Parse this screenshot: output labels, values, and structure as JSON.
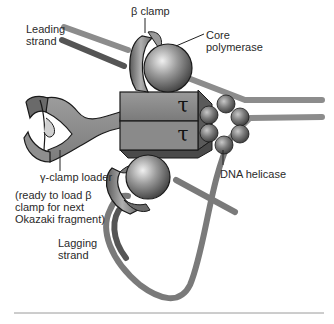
{
  "diagram": {
    "labels": {
      "beta_clamp": "β clamp",
      "core_polymerase_line1": "Core",
      "core_polymerase_line2": "polymerase",
      "leading_strand_line1": "Leading",
      "leading_strand_line2": "strand",
      "tau_top": "τ",
      "tau_bottom": "τ",
      "dna_helicase": "DNA helicase",
      "gamma_clamp_loader": "γ-clamp loader",
      "note_line1": "(ready to load β",
      "note_line2": "clamp for next",
      "note_line3": "Okazaki fragment)",
      "lagging_strand_line1": "Lagging",
      "lagging_strand_line2": "strand"
    },
    "colors": {
      "strand_light": "#8c8c8c",
      "strand_dark": "#5a5a5a",
      "protein_body": "#8a8a8a",
      "protein_dark": "#5e5e5e",
      "sphere_highlight": "#e6e6e6",
      "outline": "#1a1a1a",
      "rule": "#9a9a9a"
    }
  }
}
